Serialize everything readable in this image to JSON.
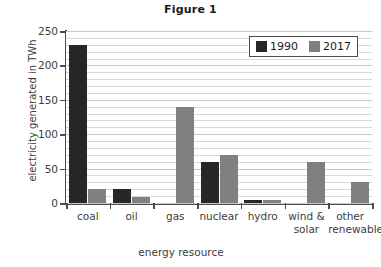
{
  "chart_data": {
    "type": "bar",
    "title": "Figure 1",
    "xlabel": "energy resource",
    "ylabel": "electricity generated in TWh",
    "categories": [
      "coal",
      "oil",
      "gas",
      "nuclear",
      "hydro",
      "wind & solar",
      "other renewables"
    ],
    "category_lines": [
      [
        "coal",
        ""
      ],
      [
        "oil",
        ""
      ],
      [
        "gas",
        ""
      ],
      [
        "nuclear",
        ""
      ],
      [
        "hydro",
        ""
      ],
      [
        "wind &",
        "solar"
      ],
      [
        "other",
        "renewables"
      ]
    ],
    "series": [
      {
        "name": "1990",
        "color": "#262626",
        "values": [
          230,
          20,
          0,
          60,
          4,
          0,
          0
        ]
      },
      {
        "name": "2017",
        "color": "#808080",
        "values": [
          20,
          9,
          140,
          70,
          4,
          59,
          30
        ]
      }
    ],
    "ylim": [
      0,
      250
    ],
    "yticks": [
      0,
      50,
      100,
      150,
      200,
      250
    ],
    "ytick_labels": [
      "0",
      "50",
      "100",
      "150",
      "200",
      "250"
    ],
    "minor_gridline_step": 10,
    "grid": true,
    "legend_position": "top-right-inside",
    "legend_entries": [
      {
        "label": "1990",
        "color": "#262626"
      },
      {
        "label": "2017",
        "color": "#808080"
      }
    ]
  }
}
